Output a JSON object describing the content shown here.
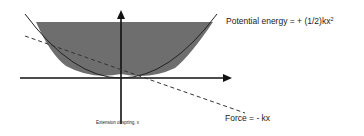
{
  "diagram": {
    "type": "spring energy graph",
    "curves": [
      {
        "name": "potential-energy",
        "label": "Potential energy = + (1/2)kx",
        "superscript": "2",
        "style": "solid",
        "shape": "parabola"
      },
      {
        "name": "force",
        "label": "Force = - kx",
        "style": "dashed",
        "shape": "line"
      }
    ],
    "x_axis_label": "Extension of spring, x",
    "shaded_region": {
      "color": "#6e6e6e"
    },
    "colors": {
      "axes": "#111111",
      "curve": "#222222",
      "shading": "#6e6e6e",
      "background": "#ffffff"
    }
  }
}
